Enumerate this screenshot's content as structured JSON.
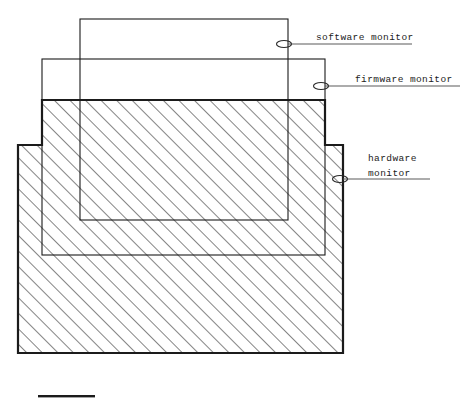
{
  "figure": {
    "kind": "nested-scope-diagram",
    "background_color": "#ffffff",
    "line_color": "#1b1b1b",
    "hatch_color": "#2a2a2a",
    "leader_color": "#5a5a5a"
  },
  "labels": [
    {
      "id": "software-monitor",
      "lines": [
        "software monitor"
      ],
      "text": "software monitor",
      "text_x": 316,
      "text_y": 40,
      "leader": {
        "x1": 288,
        "y1": 44,
        "x2": 412,
        "y2": 44
      },
      "marker": {
        "cx": 284,
        "cy": 44,
        "rx": 7.5,
        "ry": 3.5
      }
    },
    {
      "id": "firmware-monitor",
      "lines": [
        "firmware monitor"
      ],
      "text": "firmware monitor",
      "text_x": 355,
      "text_y": 82,
      "leader": {
        "x1": 325,
        "y1": 86,
        "x2": 460,
        "y2": 86
      },
      "marker": {
        "cx": 321,
        "cy": 86,
        "rx": 7.5,
        "ry": 3.5
      }
    },
    {
      "id": "hardware-monitor",
      "lines": [
        "hardware",
        "monitor"
      ],
      "text": "hardware monitor",
      "line1": "hardware",
      "line2": "monitor",
      "text_x": 368,
      "text_y": 161,
      "text_y2": 176,
      "leader": {
        "x1": 343,
        "y1": 179,
        "x2": 430,
        "y2": 179
      },
      "marker": {
        "cx": 340,
        "cy": 179,
        "rx": 7.5,
        "ry": 3.5
      }
    }
  ],
  "shapes": {
    "hardware_block": {
      "name": "hardware monitor scope",
      "style": "hatched-stepped-polygon",
      "stroke_width": 2.2,
      "points": "42,100 325,100 325,145 343,145 343,353 18,353 18,145 42,145",
      "upper": {
        "x": 42,
        "y": 100,
        "width": 283,
        "height": 45
      },
      "lower": {
        "x": 18,
        "y": 145,
        "width": 325,
        "height": 208
      }
    },
    "firmware_rect": {
      "name": "firmware monitor scope",
      "style": "thin-outline",
      "stroke_width": 1.1,
      "x": 42,
      "y": 59,
      "width": 283,
      "height": 196
    },
    "software_rect": {
      "name": "software monitor scope",
      "style": "thin-outline",
      "stroke_width": 1.1,
      "x": 80,
      "y": 19,
      "width": 208,
      "height": 201
    },
    "scale_bar": {
      "name": "scale bar",
      "x": 38,
      "y": 395,
      "width": 57,
      "height": 2.4
    }
  }
}
